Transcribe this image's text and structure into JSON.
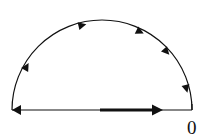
{
  "diagram": {
    "type": "contour",
    "origin_label": "0",
    "colors": {
      "stroke": "#111111",
      "background": "#ffffff"
    },
    "arc": {
      "center": [
        102,
        110
      ],
      "radius": 90,
      "direction": "clockwise",
      "arrowheads": [
        {
          "angle_deg": 150
        },
        {
          "angle_deg": 103
        },
        {
          "angle_deg": 64
        },
        {
          "angle_deg": 42
        },
        {
          "angle_deg": 14
        }
      ]
    },
    "diameter": {
      "y": 110,
      "x_start": 12,
      "x_end": 192,
      "left_arrow": "points-left",
      "thick_segment": {
        "x_start": 100,
        "x_end": 162,
        "direction": "right"
      }
    }
  }
}
